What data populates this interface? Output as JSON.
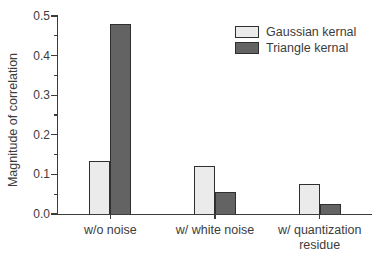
{
  "chart_data": {
    "type": "bar",
    "title": "",
    "xlabel": "",
    "ylabel": "Magnitude of correlation",
    "categories": [
      "w/o noise",
      "w/ white noise",
      "w/ quantization residue"
    ],
    "series": [
      {
        "name": "Gaussian kernal",
        "color": "#ebebeb",
        "values": [
          0.135,
          0.12,
          0.075
        ]
      },
      {
        "name": "Triangle kernal",
        "color": "#636363",
        "values": [
          0.48,
          0.055,
          0.025
        ]
      }
    ],
    "ylim": [
      0,
      0.5
    ],
    "yticks": [
      0.0,
      0.1,
      0.2,
      0.3,
      0.4,
      0.5
    ],
    "ytick_labels": [
      "0.0",
      "0.1",
      "0.2",
      "0.3",
      "0.4",
      "0.5"
    ],
    "minor_tick_step": 0.05,
    "grid": false,
    "legend_position": "upper-right",
    "colors": {
      "axis": "#3c3c3c",
      "bar_border": "#2f2f2f",
      "text": "#3c3c3c",
      "background": "#ffffff"
    }
  }
}
